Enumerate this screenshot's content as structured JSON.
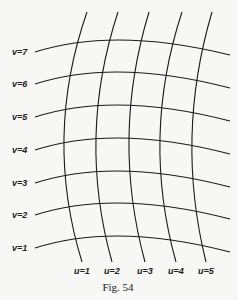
{
  "figure": {
    "caption": "Fig. 54",
    "v_curves": [
      {
        "label": "v=7",
        "y_left": 52,
        "y_peak": 40,
        "y_right": 55
      },
      {
        "label": "v=6",
        "y_left": 84,
        "y_peak": 72,
        "y_right": 88
      },
      {
        "label": "v=5",
        "y_left": 117,
        "y_peak": 105,
        "y_right": 121
      },
      {
        "label": "v=4",
        "y_left": 150,
        "y_peak": 138,
        "y_right": 154
      },
      {
        "label": "v=3",
        "y_left": 183,
        "y_peak": 171,
        "y_right": 187
      },
      {
        "label": "v=2",
        "y_left": 215,
        "y_peak": 203,
        "y_right": 219
      },
      {
        "label": "v=1",
        "y_left": 248,
        "y_peak": 236,
        "y_right": 252
      }
    ],
    "u_curves": [
      {
        "label": "u=1",
        "x_top": 87,
        "x_mid": 64,
        "x_bottom": 82
      },
      {
        "label": "u=2",
        "x_top": 118,
        "x_mid": 96,
        "x_bottom": 112
      },
      {
        "label": "u=3",
        "x_top": 149,
        "x_mid": 129,
        "x_bottom": 145
      },
      {
        "label": "u=4",
        "x_top": 182,
        "x_mid": 160,
        "x_bottom": 176
      },
      {
        "label": "u=5",
        "x_top": 212,
        "x_mid": 192,
        "x_bottom": 206
      }
    ]
  }
}
